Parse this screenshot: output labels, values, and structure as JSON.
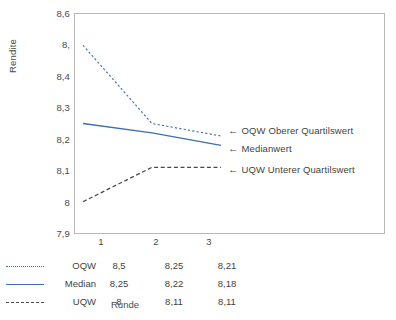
{
  "chart_data": {
    "type": "line",
    "title": "",
    "xlabel": "Runde",
    "ylabel": "Rendite",
    "categories": [
      "1",
      "2",
      "3"
    ],
    "x": [
      1,
      2,
      3
    ],
    "ylim": [
      7.9,
      8.6
    ],
    "yticks": [
      "7,9",
      "8",
      "8,1",
      "8,2",
      "8,3",
      "8,4",
      "8,",
      "8,6"
    ],
    "ytick_values": [
      7.9,
      8.0,
      8.1,
      8.2,
      8.3,
      8.4,
      8.5,
      8.6
    ],
    "grid": false,
    "legend_position": "bottom-table",
    "series": [
      {
        "name": "OQW",
        "values": [
          8.5,
          8.25,
          8.21
        ],
        "labels": [
          "8,5",
          "8,25",
          "8,21"
        ],
        "style": "dotted",
        "color": "#4a76b8"
      },
      {
        "name": "Median",
        "values": [
          8.25,
          8.22,
          8.18
        ],
        "labels": [
          "8,25",
          "8,22",
          "8,18"
        ],
        "style": "solid",
        "color": "#3f6fae"
      },
      {
        "name": "UQW",
        "values": [
          8.0,
          8.11,
          8.11
        ],
        "labels": [
          "8",
          "8,11",
          "8,11"
        ],
        "style": "dashed",
        "color": "#4a4a4a"
      }
    ],
    "annotations": [
      {
        "arrow": "←",
        "text": "OQW Oberer Quartilswert",
        "target_series": "OQW"
      },
      {
        "arrow": "←",
        "text": "Medianwert",
        "target_series": "Median"
      },
      {
        "arrow": "←",
        "text": "UQW Unterer Quartilswert",
        "target_series": "UQW"
      }
    ]
  },
  "axes": {
    "y_title": "Rendite",
    "x_title": "Runde"
  },
  "legend_table": {
    "column_headers": [
      "1",
      "2",
      "3"
    ],
    "rows": [
      {
        "name": "OQW",
        "values": [
          "8,5",
          "8,25",
          "8,21"
        ]
      },
      {
        "name": "Median",
        "values": [
          "8,25",
          "8,22",
          "8,18"
        ]
      },
      {
        "name": "UQW",
        "values": [
          "8",
          "8,11",
          "8,11"
        ]
      }
    ]
  },
  "colors": {
    "blue": "#4a76b8",
    "blue_solid": "#3f6fae",
    "dark": "#4a4a4a",
    "frame": "#b9b9b9"
  }
}
